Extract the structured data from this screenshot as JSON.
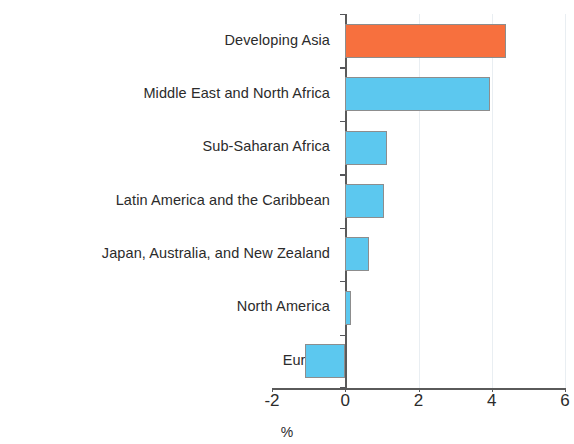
{
  "chart_data": {
    "type": "bar",
    "orientation": "horizontal",
    "title": "",
    "subtitle": "",
    "xlabel": "%",
    "ylabel": "",
    "categories": [
      "Developing Asia",
      "Middle East and North Africa",
      "Sub-Saharan Africa",
      "Latin America and the Caribbean",
      "Japan, Australia, and New Zealand",
      "North America",
      "Europe"
    ],
    "values": [
      4.4,
      3.95,
      1.15,
      1.05,
      0.65,
      0.15,
      -1.1
    ],
    "bar_colors": [
      "#f7703e",
      "#5cc8ef",
      "#5cc8ef",
      "#5cc8ef",
      "#5cc8ef",
      "#5cc8ef",
      "#5cc8ef"
    ],
    "highlight_category": "Developing Asia",
    "highlight_color": "#f7703e",
    "series_color": "#5cc8ef",
    "bar_edge_color": "#8d8d8d",
    "xlim": [
      -2,
      6
    ],
    "xticks": [
      -2,
      0,
      2,
      4,
      6
    ],
    "xtick_labels": [
      "-2",
      "0",
      "2",
      "4",
      "6"
    ],
    "grid": true,
    "gridline_values": [
      2,
      4
    ],
    "zero_line": 0,
    "legend": null,
    "legend_position": "none",
    "annotations": []
  },
  "axis": {
    "x_title": "%",
    "tick_labels": [
      "-2",
      "0",
      "2",
      "4",
      "6"
    ]
  }
}
